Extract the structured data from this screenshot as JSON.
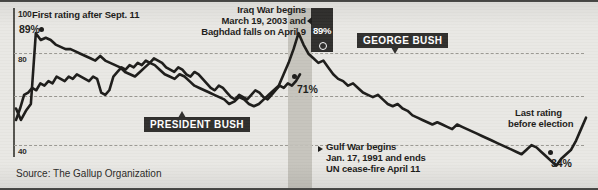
{
  "axis": {
    "yticks": [
      {
        "label": "100",
        "value": 100
      },
      {
        "label": "80",
        "value": 80
      },
      {
        "label": "",
        "value": 60
      },
      {
        "label": "40",
        "value": 40
      }
    ],
    "ymin": 25,
    "ymax": 100
  },
  "annotations": {
    "sept11": "First rating after Sept. 11",
    "sept11_value": "89%",
    "iraq_line1": "Iraq War begins",
    "iraq_line2": "March 19, 2003 and",
    "iraq_line3": "Baghdad falls on April 9",
    "iraq_peak_value": "89%",
    "gulf_line1": "Gulf War begins",
    "gulf_line2": "Jan. 17, 1991 and ends",
    "gulf_line3": "UN cease-fire April 11",
    "gulf_value": "71%",
    "last_line1": "Last rating",
    "last_line2": "before election",
    "last_value": "34%"
  },
  "tags": {
    "president_bush": "PRESIDENT BUSH",
    "george_bush": "GEORGE BUSH"
  },
  "source": "Source: The Gallup Organization",
  "colors": {
    "background": "#e9e8e4",
    "line": "#1d1c1a",
    "band": "#c2c0ba",
    "tag_bg": "#2f2e2c",
    "grid": "#9a9892"
  },
  "chart_data": {
    "type": "line",
    "title": "",
    "xlabel": "",
    "ylabel": "Approval rating (%)",
    "ylim": [
      25,
      100
    ],
    "grid": true,
    "legend": [
      "PRESIDENT BUSH",
      "GEORGE BUSH"
    ],
    "legend_position": "inline-callout",
    "yticks": [
      100,
      80,
      60,
      40
    ],
    "annotations": [
      {
        "text": "First rating after Sept. 11",
        "value": 89,
        "series": "GEORGE BUSH"
      },
      {
        "text": "Iraq War begins March 19, 2003 and Baghdad falls on April 9",
        "value": 89,
        "series": "GEORGE BUSH"
      },
      {
        "text": "Gulf War begins Jan. 17, 1991 and ends UN cease-fire April 11",
        "value": 71,
        "series": "PRESIDENT BUSH"
      },
      {
        "text": "Last rating before election",
        "value": 34,
        "series": "PRESIDENT BUSH"
      }
    ],
    "series": [
      {
        "name": "GEORGE BUSH",
        "values": [
          56,
          51,
          55,
          58,
          89,
          86,
          87,
          86,
          84,
          83,
          82,
          82,
          81,
          80,
          79,
          78,
          77,
          79,
          77,
          76,
          75,
          74,
          72,
          71,
          70,
          72,
          74,
          76,
          75,
          73,
          71,
          70,
          69,
          71,
          70,
          68,
          66,
          65,
          64,
          63,
          62,
          61,
          60,
          58,
          59,
          61,
          60,
          58,
          57,
          58,
          60,
          62,
          64,
          66,
          71,
          76,
          82,
          89,
          84,
          80,
          78,
          76,
          77,
          74,
          71,
          69,
          68,
          66,
          67,
          65,
          63,
          62,
          61,
          62,
          60,
          58,
          57,
          58,
          56,
          55,
          53,
          52,
          51,
          50,
          49,
          50,
          49,
          48,
          47,
          49,
          48,
          47,
          46,
          45,
          44,
          43,
          42,
          41,
          40,
          39,
          38,
          37,
          36,
          38,
          40,
          39,
          37,
          35,
          33,
          31,
          34,
          36,
          38,
          42,
          47,
          52
        ]
      },
      {
        "name": "PRESIDENT BUSH",
        "values": [
          51,
          56,
          62,
          63,
          65,
          64,
          67,
          66,
          68,
          67,
          70,
          69,
          68,
          70,
          69,
          71,
          70,
          69,
          68,
          70,
          69,
          63,
          62,
          64,
          70,
          72,
          74,
          73,
          75,
          74,
          76,
          75,
          77,
          76,
          78,
          77,
          76,
          74,
          73,
          72,
          74,
          73,
          71,
          70,
          72,
          71,
          69,
          67,
          65,
          64,
          66,
          65,
          63,
          61,
          60,
          62,
          61,
          60,
          62,
          64,
          63,
          61,
          60,
          62,
          64,
          66,
          65,
          67,
          66,
          68,
          71
        ]
      }
    ]
  }
}
